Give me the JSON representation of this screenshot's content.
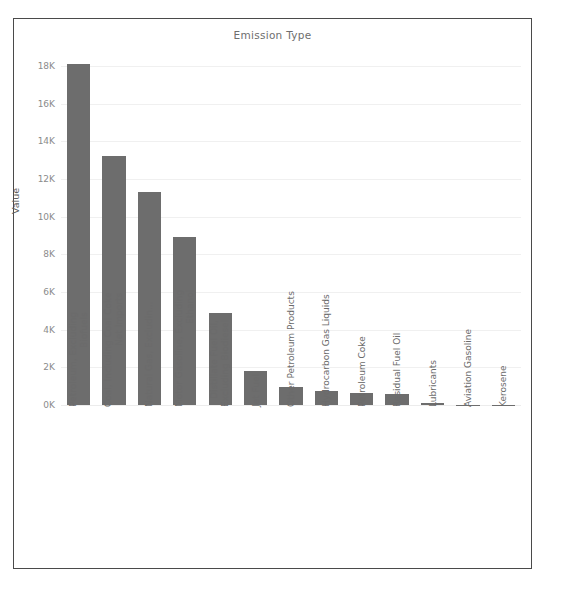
{
  "chart_data": {
    "type": "bar",
    "title": "Emission Type",
    "xlabel": "",
    "ylabel": "Value",
    "ylim": [
      0,
      19000
    ],
    "grid": true,
    "legend": null,
    "ytick_labels": [
      "18K",
      "16K",
      "14K",
      "12K",
      "10K",
      "8K",
      "6K",
      "4K",
      "2K",
      "0K"
    ],
    "ytick_values": [
      18000,
      16000,
      14000,
      12000,
      10000,
      8000,
      6000,
      4000,
      2000,
      0
    ],
    "categories": [
      "Petroleum, Excluding\nBiofuels",
      "Coal, Including Coal Coke\nNet Imports",
      "Natural Gas, Excludin...",
      "Motor Gasoline, Excluding\nEthanol",
      "Distillate Fuel Oil,\nExcluding Biodiesel",
      "Jet Fuel",
      "Other Petroleum Products",
      "Hydrocarbon Gas Liquids",
      "Petroleum Coke",
      "Residual Fuel Oil",
      "Lubricants",
      "Aviation Gasoline",
      "Kerosene"
    ],
    "values": [
      18100,
      13200,
      11300,
      8900,
      4900,
      1800,
      930,
      760,
      650,
      560,
      110,
      20,
      10
    ],
    "bar_color": "#6d6d6d",
    "gridline_color": "#f0f0f0"
  },
  "frame": {
    "border_color": "#4a4a4a",
    "background": "#ffffff"
  }
}
